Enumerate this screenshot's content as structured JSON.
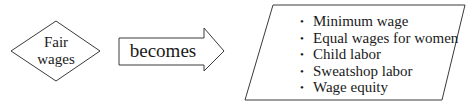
{
  "diagram": {
    "source_node": {
      "shape": "diamond",
      "lines": [
        "Fair",
        "wages"
      ]
    },
    "connector": {
      "shape": "block-arrow",
      "label": "becomes"
    },
    "target_node": {
      "shape": "parallelogram",
      "bullet_glyph": "•",
      "items": [
        "Minimum wage",
        "Equal wages for women",
        "Child labor",
        "Sweatshop labor",
        "Wage equity"
      ]
    },
    "colors": {
      "stroke": "#3a3a3a",
      "fill": "#ffffff",
      "text": "#1a1a1a"
    }
  }
}
